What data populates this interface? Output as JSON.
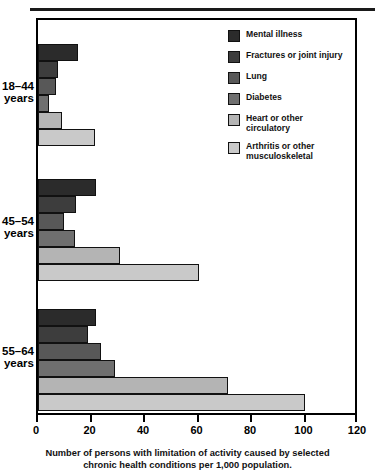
{
  "title": "",
  "caption": {
    "line1": "Number of persons with limitation of activity caused by selected",
    "line2": "chronic health conditions per 1,000 population."
  },
  "legend": [
    {
      "label": "Mental illness",
      "color": "#2b2b2b"
    },
    {
      "label": "Fractures or joint injury",
      "color": "#3d3d3d"
    },
    {
      "label": "Lung",
      "color": "#585858"
    },
    {
      "label": "Diabetes",
      "color": "#6f6f6f"
    },
    {
      "label": "Heart or other\ncirculatory",
      "color": "#b4b4b4"
    },
    {
      "label": "Arthritis or other\nmusculoskeletal",
      "color": "#c9c9c9"
    }
  ],
  "groups": [
    {
      "label": "18–44\nyears"
    },
    {
      "label": "45–54\nyears"
    },
    {
      "label": "55–64\nyears"
    }
  ],
  "axis": {
    "ticks": [
      "0",
      "20",
      "40",
      "60",
      "80",
      "100",
      "120"
    ],
    "min": 0,
    "max": 120
  },
  "chart_data": {
    "type": "bar",
    "orientation": "horizontal",
    "title": "",
    "xlabel": "Number of persons with limitation of activity caused by selected chronic health conditions per 1,000 population.",
    "ylabel": "",
    "xlim": [
      0,
      120
    ],
    "grid": false,
    "legend_position": "right-inside",
    "categories": [
      "18–44 years",
      "45–54 years",
      "55–64 years"
    ],
    "series": [
      {
        "name": "Mental illness",
        "color": "#2b2b2b",
        "values": [
          15,
          22,
          22
        ]
      },
      {
        "name": "Fractures or joint injury",
        "color": "#3d3d3d",
        "values": [
          7.5,
          14.5,
          19
        ]
      },
      {
        "name": "Lung",
        "color": "#585858",
        "values": [
          7,
          10,
          24
        ]
      },
      {
        "name": "Diabetes",
        "color": "#6f6f6f",
        "values": [
          4,
          14,
          29
        ]
      },
      {
        "name": "Heart or other circulatory",
        "color": "#b4b4b4",
        "values": [
          9,
          31,
          72
        ]
      },
      {
        "name": "Arthritis or other musculoskeletal",
        "color": "#c9c9c9",
        "values": [
          21.5,
          61,
          101
        ]
      }
    ]
  }
}
